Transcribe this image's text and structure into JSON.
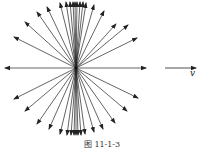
{
  "figure": {
    "caption": "图 11-1-3",
    "velocity_label": "v",
    "center": [
      76,
      68
    ],
    "line_color": "#222222",
    "rays": [
      [
        60,
        3
      ],
      [
        66,
        2
      ],
      [
        70,
        2
      ],
      [
        73,
        2
      ],
      [
        75,
        2
      ],
      [
        77,
        2
      ],
      [
        80,
        2
      ],
      [
        83,
        2
      ],
      [
        86,
        3
      ],
      [
        94,
        5
      ],
      [
        47,
        7
      ],
      [
        37,
        12
      ],
      [
        25,
        22
      ],
      [
        14,
        37
      ],
      [
        104,
        11
      ],
      [
        116,
        24
      ],
      [
        128,
        25
      ],
      [
        137,
        38
      ],
      [
        5,
        68
      ],
      [
        146,
        68
      ],
      [
        14,
        99
      ],
      [
        25,
        111
      ],
      [
        37,
        124
      ],
      [
        49,
        129
      ],
      [
        138,
        98
      ],
      [
        127,
        111
      ],
      [
        115,
        123
      ],
      [
        103,
        129
      ],
      [
        60,
        134
      ],
      [
        67,
        135
      ],
      [
        71,
        135
      ],
      [
        74,
        135
      ],
      [
        76,
        135
      ],
      [
        78,
        135
      ],
      [
        81,
        135
      ],
      [
        85,
        134
      ],
      [
        94,
        132
      ]
    ],
    "velocity_arrow": {
      "from": [
        165,
        68
      ],
      "to": [
        196,
        68
      ]
    }
  }
}
